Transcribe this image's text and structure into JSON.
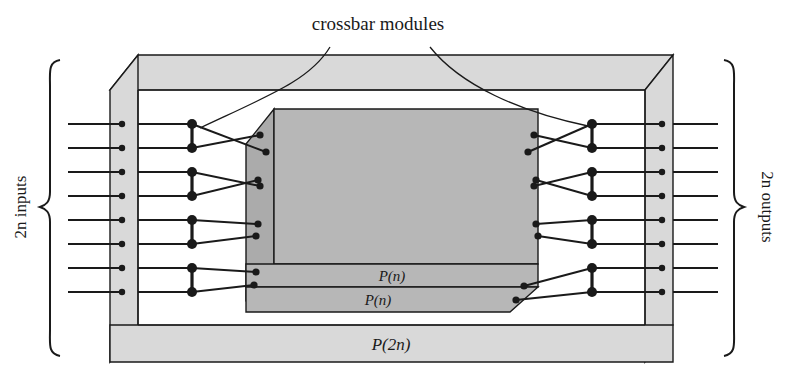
{
  "figure": {
    "title": "crossbar modules",
    "labels": {
      "inputs": "2n inputs",
      "outputs": "2n outputs",
      "inner_top_band": "P(n)",
      "inner_bottom_band": "P(n)",
      "outer_bottom_band": "P(2n)"
    },
    "colors": {
      "stroke": "#1a1a1a",
      "outer_face": "#d9d9d9",
      "outer_face_dark": "#cfcfcf",
      "inner_face": "#b7b7b7",
      "inner_face_dark": "#ababab",
      "background": "#ffffff",
      "node": "#1a1a1a"
    },
    "counts": {
      "inputs": 8,
      "outputs": 8,
      "left_crossbar_modules": 4,
      "right_crossbar_modules": 4
    },
    "structure": {
      "input_rows_y": [
        124,
        148,
        172,
        196,
        220,
        244,
        268,
        292
      ],
      "left_wall_node_x": 122,
      "left_module_node_x": 192,
      "inner_left_port_x": 262,
      "inner_right_port_x": 538,
      "right_module_node_x": 592,
      "right_wall_node_x": 662
    }
  }
}
